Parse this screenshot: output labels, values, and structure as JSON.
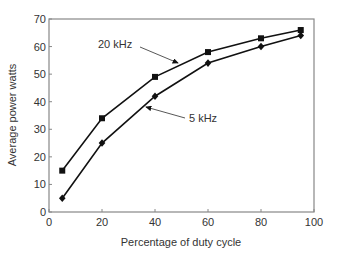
{
  "chart_data": {
    "type": "line",
    "title": "",
    "xlabel": "Percentage of duty cycle",
    "ylabel": "Average power watts",
    "xlim": [
      0,
      100
    ],
    "ylim": [
      0,
      70
    ],
    "xticks": [
      0,
      20,
      40,
      60,
      80,
      100
    ],
    "yticks": [
      0,
      10,
      20,
      30,
      40,
      50,
      60,
      70
    ],
    "grid": false,
    "legend": "inline annotations with arrows",
    "x": [
      5,
      20,
      40,
      60,
      80,
      95
    ],
    "series": [
      {
        "name": "20 kHz",
        "marker": "square",
        "values": [
          15,
          34,
          49,
          58,
          63,
          66
        ]
      },
      {
        "name": "5 kHz",
        "marker": "diamond",
        "values": [
          5,
          25,
          42,
          54,
          60,
          64
        ]
      }
    ],
    "annotations": [
      {
        "text": "20 kHz",
        "points_to_series": "20 kHz"
      },
      {
        "text": "5 kHz",
        "points_to_series": "5 kHz"
      }
    ],
    "colors": {
      "line": "#111111",
      "axis": "#888888",
      "text": "#333333"
    }
  }
}
